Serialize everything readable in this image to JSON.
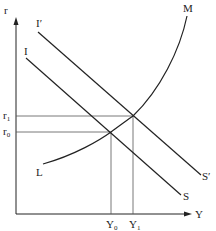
{
  "diagram": {
    "type": "IS-LM style economics diagram",
    "axes": {
      "y_label": "r",
      "x_label": "Y"
    },
    "curves": {
      "I": {
        "label": "I"
      },
      "I_prime": {
        "label": "I′"
      },
      "S": {
        "label": "S"
      },
      "S_prime": {
        "label": "S′"
      },
      "L_start": {
        "label": "L"
      },
      "M_end": {
        "label": "M"
      }
    },
    "levels": {
      "r0": {
        "base": "r",
        "sub": "0"
      },
      "r1": {
        "base": "r",
        "sub": "1"
      },
      "Y0": {
        "base": "Y",
        "sub": "0"
      },
      "Y1": {
        "base": "Y",
        "sub": "1"
      }
    },
    "colors": {
      "line": "#222222",
      "guide": "#555555",
      "background": "#ffffff"
    }
  }
}
